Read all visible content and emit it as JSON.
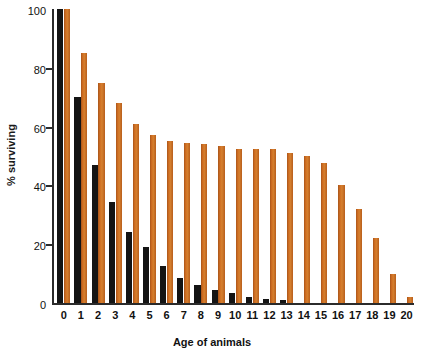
{
  "chart_data": {
    "type": "bar",
    "title": "",
    "xlabel": "Age of animals",
    "ylabel": "% surviving",
    "categories": [
      "0",
      "1",
      "2",
      "3",
      "4",
      "5",
      "6",
      "7",
      "8",
      "9",
      "10",
      "11",
      "12",
      "13",
      "14",
      "15",
      "16",
      "17",
      "18",
      "19",
      "20"
    ],
    "ylim": [
      0,
      100
    ],
    "yticks": [
      0,
      20,
      40,
      60,
      80,
      100
    ],
    "ytick_labels": [
      "0",
      "20",
      "40",
      "60",
      "80",
      "100"
    ],
    "grid": false,
    "legend": "none",
    "series": [
      {
        "name": "black-series",
        "color": "#141414",
        "values": [
          100,
          70,
          47,
          34.5,
          24,
          19,
          12.5,
          8.5,
          6,
          4.5,
          3.5,
          2,
          1.5,
          1,
          0,
          0,
          0,
          0,
          0,
          0,
          0
        ]
      },
      {
        "name": "orange-series",
        "color": "#c8661e",
        "values": [
          100,
          85,
          75,
          68,
          61,
          57,
          55,
          54.5,
          54,
          53.5,
          52.5,
          52.5,
          52.5,
          51,
          50,
          47.5,
          40,
          32,
          22,
          10,
          2
        ]
      }
    ]
  },
  "axes": {
    "y_title": "% surviving",
    "x_title": "Age of animals"
  }
}
